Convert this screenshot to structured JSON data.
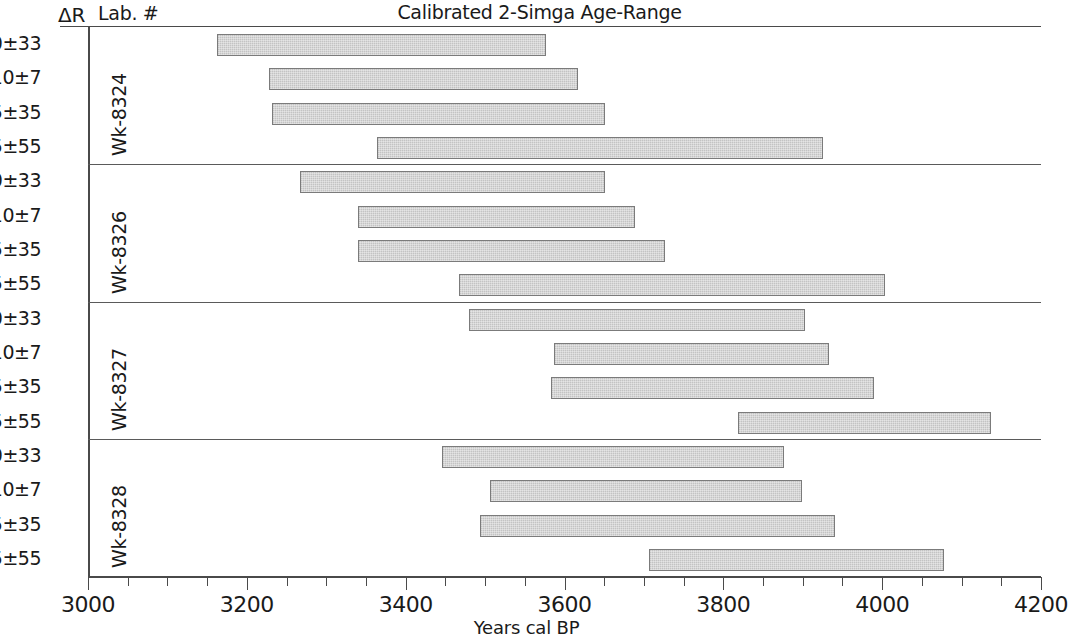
{
  "header": {
    "dr_header": "ΔR",
    "lab_header": "Lab. #",
    "title": "Calibrated 2-Simga Age-Range"
  },
  "axis": {
    "xlabel": "Years cal BP",
    "x_min": 3000,
    "x_max": 4200,
    "major_step": 200,
    "minor_step": 50,
    "major_ticks": [
      "3000",
      "3200",
      "3400",
      "3600",
      "3800",
      "4000",
      "4200"
    ]
  },
  "style": {
    "bar_fill": "#cdcdcd",
    "bar_stroke": "#7b7b7b",
    "axis_color": "#4a4a4a",
    "text_color": "#1a1a1a"
  },
  "chart_data": {
    "type": "bar",
    "orientation": "horizontal-range",
    "title": "Calibrated 2-Simga Age-Range",
    "xlabel": "Years cal BP",
    "ylabel": "",
    "xlim": [
      3000,
      4200
    ],
    "grid": false,
    "legend": false,
    "group_label_name": "Lab. #",
    "row_label_name": "ΔR",
    "groups": [
      {
        "lab": "Wk-8324",
        "rows": [
          {
            "dr": "+50±33",
            "start": 3162,
            "end": 3577
          },
          {
            "dr": "+10±7",
            "start": 3228,
            "end": 3617
          },
          {
            "dr": "-5±35",
            "start": 3232,
            "end": 3651
          },
          {
            "dr": "-155±55",
            "start": 3364,
            "end": 3926
          }
        ]
      },
      {
        "lab": "Wk-8326",
        "rows": [
          {
            "dr": "+50±33",
            "start": 3267,
            "end": 3651
          },
          {
            "dr": "+10±7",
            "start": 3340,
            "end": 3689
          },
          {
            "dr": "-5±35",
            "start": 3340,
            "end": 3727
          },
          {
            "dr": "-155±55",
            "start": 3467,
            "end": 4004
          }
        ]
      },
      {
        "lab": "Wk-8327",
        "rows": [
          {
            "dr": "+50±33",
            "start": 3480,
            "end": 3903
          },
          {
            "dr": "+10±7",
            "start": 3587,
            "end": 3933
          },
          {
            "dr": "-5±35",
            "start": 3583,
            "end": 3990
          },
          {
            "dr": "-155±55",
            "start": 3819,
            "end": 4137
          }
        ]
      },
      {
        "lab": "Wk-8328",
        "rows": [
          {
            "dr": "+50±33",
            "start": 3446,
            "end": 3877
          },
          {
            "dr": "+10±7",
            "start": 3506,
            "end": 3899
          },
          {
            "dr": "-5±35",
            "start": 3493,
            "end": 3941
          },
          {
            "dr": "-155±55",
            "start": 3707,
            "end": 4078
          }
        ]
      }
    ]
  }
}
